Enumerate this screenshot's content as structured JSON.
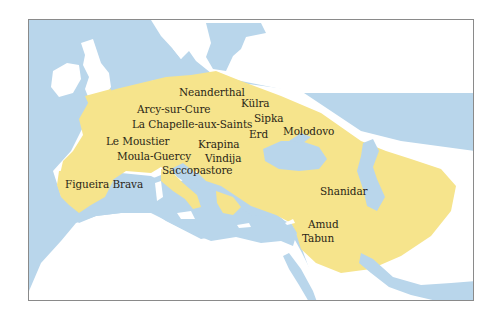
{
  "map": {
    "subject": "Neanderthal range and fossil sites",
    "colors": {
      "water": "#b9d6eb",
      "land": "#ffffff",
      "range": "#f6e48c",
      "border": "#8a8a8a",
      "label": "#2a2616"
    },
    "sites": [
      {
        "name": "Neanderthal",
        "x": 178,
        "y": 86
      },
      {
        "name": "Külra",
        "x": 240,
        "y": 97
      },
      {
        "name": "Arcy-sur-Cure",
        "x": 136,
        "y": 103
      },
      {
        "name": "Sipka",
        "x": 253,
        "y": 112
      },
      {
        "name": "La Chapelle-aux-Saints",
        "x": 131,
        "y": 118
      },
      {
        "name": "Erd",
        "x": 248,
        "y": 128
      },
      {
        "name": "Molodovo",
        "x": 282,
        "y": 125
      },
      {
        "name": "Le Moustier",
        "x": 105,
        "y": 135
      },
      {
        "name": "Krapina",
        "x": 197,
        "y": 138
      },
      {
        "name": "Moula-Guercy",
        "x": 116,
        "y": 150
      },
      {
        "name": "Vindija",
        "x": 204,
        "y": 152
      },
      {
        "name": "Saccopastore",
        "x": 161,
        "y": 164
      },
      {
        "name": "Figueira Brava",
        "x": 64,
        "y": 178
      },
      {
        "name": "Shanidar",
        "x": 319,
        "y": 185
      },
      {
        "name": "Amud",
        "x": 307,
        "y": 218
      },
      {
        "name": "Tabun",
        "x": 301,
        "y": 232
      }
    ]
  }
}
